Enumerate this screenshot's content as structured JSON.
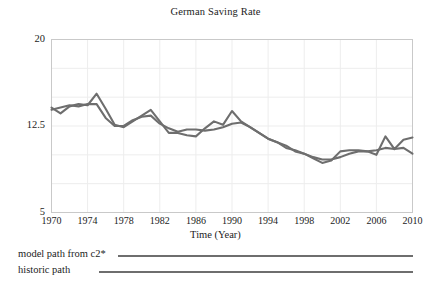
{
  "chart_data": {
    "type": "line",
    "title": "German Saving Rate",
    "xlabel": "Time (Year)",
    "ylabel": "",
    "xlim": [
      1970,
      2010
    ],
    "ylim": [
      5,
      20
    ],
    "grid": true,
    "legend_position": "below",
    "ytick_labels": [
      "20",
      "12.5",
      "5"
    ],
    "ytick_values": [
      20,
      12.5,
      5
    ],
    "xtick_labels": [
      "1970",
      "1974",
      "1978",
      "1982",
      "1986",
      "1990",
      "1994",
      "1998",
      "2002",
      "2006",
      "2010"
    ],
    "xtick_values": [
      1970,
      1974,
      1978,
      1982,
      1986,
      1990,
      1994,
      1998,
      2002,
      2006,
      2010
    ],
    "x": [
      1970,
      1971,
      1972,
      1973,
      1974,
      1975,
      1976,
      1977,
      1978,
      1979,
      1980,
      1981,
      1982,
      1983,
      1984,
      1985,
      1986,
      1987,
      1988,
      1989,
      1990,
      1991,
      1992,
      1993,
      1994,
      1995,
      1996,
      1997,
      1998,
      1999,
      2000,
      2001,
      2002,
      2003,
      2004,
      2005,
      2006,
      2007,
      2008,
      2009,
      2010
    ],
    "series": [
      {
        "name": "model path from c2*",
        "color": "#6e6e6e",
        "values": [
          14.1,
          13.6,
          14.2,
          14.4,
          14.3,
          15.3,
          14.0,
          12.6,
          12.4,
          12.9,
          13.4,
          13.9,
          12.9,
          11.9,
          11.9,
          11.7,
          11.6,
          12.3,
          12.9,
          12.6,
          13.8,
          12.9,
          12.4,
          11.9,
          11.4,
          11.1,
          10.8,
          10.3,
          10.1,
          9.7,
          9.3,
          9.5,
          10.3,
          10.4,
          10.4,
          10.3,
          10.0,
          11.6,
          10.5,
          11.3,
          11.5
        ]
      },
      {
        "name": "historic path",
        "color": "#6e6e6e",
        "values": [
          13.9,
          14.1,
          14.3,
          14.2,
          14.4,
          14.4,
          13.2,
          12.5,
          12.5,
          13.0,
          13.3,
          13.4,
          12.7,
          12.3,
          12.0,
          12.2,
          12.2,
          12.1,
          12.2,
          12.4,
          12.7,
          12.8,
          12.4,
          11.9,
          11.4,
          11.1,
          10.6,
          10.4,
          10.1,
          9.8,
          9.6,
          9.6,
          9.8,
          10.1,
          10.3,
          10.3,
          10.4,
          10.6,
          10.5,
          10.6,
          10.1
        ]
      }
    ]
  },
  "legend": {
    "entries": [
      {
        "label": "model path from c2*"
      },
      {
        "label": "historic path"
      }
    ]
  }
}
